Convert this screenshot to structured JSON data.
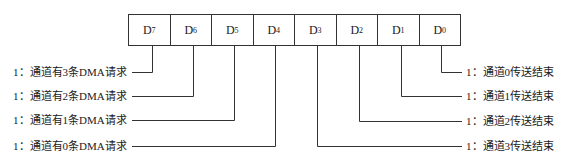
{
  "diagram": {
    "register_bits": [
      {
        "name": "D",
        "sub": "7"
      },
      {
        "name": "D",
        "sub": "6"
      },
      {
        "name": "D",
        "sub": "5"
      },
      {
        "name": "D",
        "sub": "4"
      },
      {
        "name": "D",
        "sub": "3"
      },
      {
        "name": "D",
        "sub": "2"
      },
      {
        "name": "D",
        "sub": "1"
      },
      {
        "name": "D",
        "sub": "0"
      }
    ],
    "left_labels": [
      "1：通道有3条DMA请求",
      "1：通道有2条DMA请求",
      "1：通道有1条DMA请求",
      "1：通道有0条DMA请求"
    ],
    "right_labels": [
      "1：通道0传送结束",
      "1：通道1传送结束",
      "1：通道2传送结束",
      "1：通道3传送结束"
    ],
    "line_color": "#333333"
  }
}
